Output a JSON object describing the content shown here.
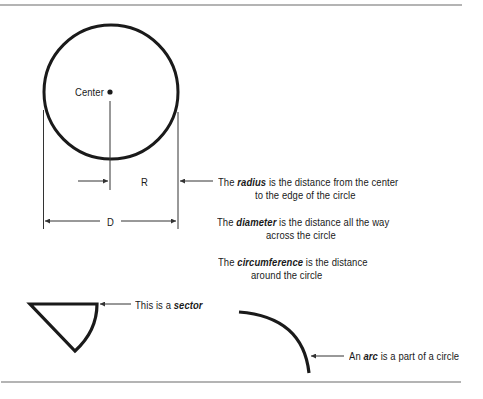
{
  "figure": {
    "center_label": "Center",
    "radius_marker": "R",
    "diameter_marker": "D"
  },
  "definitions": {
    "radius": {
      "prefix": "The",
      "term": "radius",
      "line1_rest": "is the distance from the center",
      "line2": "to the edge of the circle"
    },
    "diameter": {
      "prefix": "The",
      "term": "diameter",
      "line1_rest": "is the distance all the way",
      "line2": "across the circle"
    },
    "circumference": {
      "prefix": "The",
      "term": "circumference",
      "line1_rest": "is the distance",
      "line2": "around the circle"
    },
    "sector": {
      "prefix": "This is a",
      "term": "sector"
    },
    "arc": {
      "prefix": "An",
      "term": "arc",
      "rest": "is a part of a circle"
    }
  },
  "colors": {
    "ink": "#1a1a1a",
    "rule": "#6b6b6b",
    "arrow": "#333333"
  }
}
